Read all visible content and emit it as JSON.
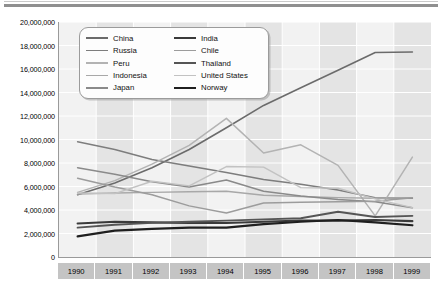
{
  "chart_data": {
    "type": "line",
    "title": "",
    "xlabel": "",
    "ylabel": "",
    "x": [
      1990,
      1991,
      1992,
      1993,
      1994,
      1995,
      1996,
      1997,
      1998,
      1999
    ],
    "categories": [
      "1990",
      "1991",
      "1992",
      "1993",
      "1994",
      "1995",
      "1996",
      "1997",
      "1998",
      "1999"
    ],
    "ylim": [
      0,
      20000000
    ],
    "ytick_values": [
      20000000,
      18000000,
      16000000,
      14000000,
      12000000,
      10000000,
      8000000,
      6000000,
      4000000,
      2000000,
      0
    ],
    "ytick_labels": [
      "20,000,000",
      "18,000,000",
      "16,000,000",
      "14,000,000",
      "12,000,000",
      "10,000,000",
      "8,000,000",
      "6,000,000",
      "4,000,000",
      "2,000,000",
      "0"
    ],
    "grid": true,
    "legend_position": "upper-left-inside",
    "series": [
      {
        "name": "China",
        "color": "#6b6b6b",
        "width": 1.6,
        "values": [
          5300000,
          6300000,
          7600000,
          9150000,
          11000000,
          12900000,
          14400000,
          15900000,
          17400000,
          17450000
        ]
      },
      {
        "name": "Russia",
        "color": "#7d7d7d",
        "width": 1.5,
        "values": [
          9800000,
          9150000,
          8300000,
          7750000,
          7200000,
          6600000,
          6200000,
          5700000,
          5050000,
          5000000
        ]
      },
      {
        "name": "Peru",
        "color": "#b3b3b3",
        "width": 1.5,
        "values": [
          5500000,
          6500000,
          7900000,
          9500000,
          11800000,
          8850000,
          9550000,
          7800000,
          3500000,
          8500000
        ]
      },
      {
        "name": "Indonesia",
        "color": "#a8a8a8",
        "width": 1.4,
        "values": [
          5350000,
          5450000,
          5500000,
          5550000,
          5600000,
          5250000,
          5150000,
          5050000,
          5000000,
          5050000
        ]
      },
      {
        "name": "Japan",
        "color": "#8a8a8a",
        "width": 1.5,
        "values": [
          7600000,
          7050000,
          6400000,
          5950000,
          6550000,
          5600000,
          5200000,
          4900000,
          4700000,
          4200000
        ]
      },
      {
        "name": "India",
        "color": "#3a3a3a",
        "width": 2.1,
        "values": [
          2850000,
          3000000,
          2950000,
          2900000,
          2900000,
          3000000,
          3100000,
          3100000,
          3150000,
          3050000
        ]
      },
      {
        "name": "Chile",
        "color": "#9c9c9c",
        "width": 1.5,
        "values": [
          6700000,
          5950000,
          5300000,
          4350000,
          3750000,
          4600000,
          4650000,
          4700000,
          4750000,
          5050000
        ]
      },
      {
        "name": "Thailand",
        "color": "#555555",
        "width": 1.9,
        "values": [
          2500000,
          2750000,
          2900000,
          3000000,
          3100000,
          3200000,
          3300000,
          3850000,
          3400000,
          3500000
        ]
      },
      {
        "name": "United States",
        "color": "#c2c2c2",
        "width": 1.4,
        "values": [
          5450000,
          5400000,
          6450000,
          6050000,
          7700000,
          7650000,
          5900000,
          5850000,
          4950000,
          4200000
        ]
      },
      {
        "name": "Norway",
        "color": "#1f1f1f",
        "width": 2.2,
        "values": [
          1750000,
          2250000,
          2400000,
          2500000,
          2500000,
          2800000,
          3000000,
          3150000,
          2950000,
          2700000
        ]
      }
    ]
  },
  "legend": {
    "columns": [
      [
        {
          "label": "China"
        },
        {
          "label": "Russia"
        },
        {
          "label": "Peru"
        },
        {
          "label": "Indonesia"
        },
        {
          "label": "Japan"
        }
      ],
      [
        {
          "label": "India"
        },
        {
          "label": "Chile"
        },
        {
          "label": "Thailand"
        },
        {
          "label": "United States"
        },
        {
          "label": "Norway"
        }
      ]
    ]
  },
  "colors": {
    "plot_background": "#f2f2f2",
    "band": "#e4e4e4",
    "gridline": "#ffffff",
    "axis": "#9a9a9a",
    "xtick_background": "#c4c4c4",
    "rule": "#8f8f8f"
  }
}
